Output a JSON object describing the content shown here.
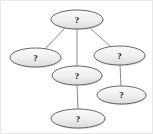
{
  "diagram": {
    "background_color": "#ffffff",
    "node_fill_color": "#ececec",
    "node_fill_top_color": "#f8f8f8",
    "node_stroke_color": "#555555",
    "edge_color": "#8a8a8a",
    "label_color": "#1a1a1a",
    "node_count": 6,
    "edge_count": 5,
    "nodes": [
      {
        "id": "n1",
        "label": "?",
        "cx": 76,
        "cy": 18.5,
        "rx": 26,
        "ry": 9.5
      },
      {
        "id": "n2",
        "label": "?",
        "cx": 34.5,
        "cy": 56.5,
        "rx": 25.5,
        "ry": 9.5
      },
      {
        "id": "n3",
        "label": "?",
        "cx": 118.5,
        "cy": 54.5,
        "rx": 25.5,
        "ry": 9.5
      },
      {
        "id": "n4",
        "label": "?",
        "cx": 76,
        "cy": 74.5,
        "rx": 25,
        "ry": 9.5
      },
      {
        "id": "n5",
        "label": "?",
        "cx": 120.5,
        "cy": 94,
        "rx": 24.5,
        "ry": 9
      },
      {
        "id": "n6",
        "label": "?",
        "cx": 77,
        "cy": 117.5,
        "rx": 27,
        "ry": 9.5
      }
    ],
    "edges": [
      {
        "id": "e1",
        "from": "n1",
        "to": "n2",
        "x1": 64,
        "y1": 27,
        "x2": 44,
        "y2": 48
      },
      {
        "id": "e2",
        "from": "n1",
        "to": "n4",
        "x1": 76,
        "y1": 28,
        "x2": 76,
        "y2": 65
      },
      {
        "id": "e3",
        "from": "n1",
        "to": "n3",
        "x1": 89,
        "y1": 27,
        "x2": 110,
        "y2": 46
      },
      {
        "id": "e4",
        "from": "n3",
        "to": "n5",
        "x1": 119,
        "y1": 64,
        "x2": 120,
        "y2": 85
      },
      {
        "id": "e5",
        "from": "n4",
        "to": "n6",
        "x1": 76,
        "y1": 84,
        "x2": 77,
        "y2": 108
      }
    ]
  }
}
